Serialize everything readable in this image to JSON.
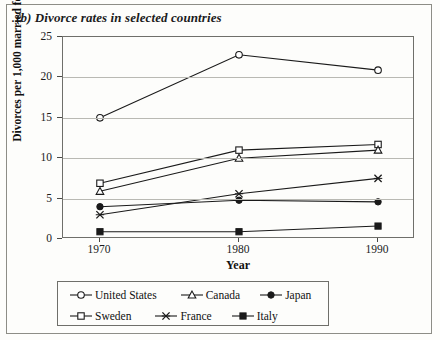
{
  "figure": {
    "title": "(b) Divorce rates in selected countries"
  },
  "chart_data": {
    "type": "line",
    "title": "(b) Divorce rates in selected countries",
    "xlabel": "Year",
    "ylabel": "Divorces per 1,000 married females",
    "x": [
      1970,
      1980,
      1990
    ],
    "xtick_labels": [
      "1970",
      "1980",
      "1990"
    ],
    "ytick_labels": [
      "0",
      "5",
      "10",
      "15",
      "20",
      "25"
    ],
    "yticks": [
      0,
      5,
      10,
      15,
      20,
      25
    ],
    "ylim": [
      0,
      25
    ],
    "grid": true,
    "legend_position": "below-plot",
    "series": [
      {
        "name": "United States",
        "marker": "open-circle",
        "values": [
          15.0,
          22.8,
          20.9
        ]
      },
      {
        "name": "Sweden",
        "marker": "open-square",
        "values": [
          6.9,
          11.0,
          11.7
        ]
      },
      {
        "name": "Canada",
        "marker": "open-triangle",
        "values": [
          5.9,
          10.0,
          11.0
        ]
      },
      {
        "name": "Japan",
        "marker": "filled-circle",
        "values": [
          4.0,
          4.8,
          4.6
        ]
      },
      {
        "name": "France",
        "marker": "cross",
        "values": [
          3.0,
          5.6,
          7.5
        ]
      },
      {
        "name": "Italy",
        "marker": "filled-square",
        "values": [
          0.9,
          0.9,
          1.6
        ]
      }
    ]
  },
  "legend": {
    "rows": [
      [
        {
          "label": "United States",
          "marker": "open-circle"
        },
        {
          "label": "Canada",
          "marker": "open-triangle"
        },
        {
          "label": "Japan",
          "marker": "filled-circle"
        }
      ],
      [
        {
          "label": "Sweden",
          "marker": "open-square"
        },
        {
          "label": "France",
          "marker": "cross"
        },
        {
          "label": "Italy",
          "marker": "filled-square"
        }
      ]
    ]
  },
  "colors": {
    "line": "#1a1a1a",
    "grid": "#b9b9b3",
    "axis": "#6f6f6a",
    "background": "#fdfdfb",
    "text": "#111111"
  }
}
